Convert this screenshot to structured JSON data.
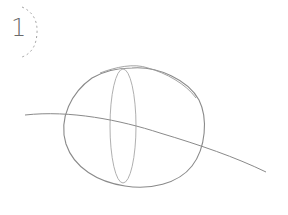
{
  "step": {
    "number": "1"
  },
  "drawing": {
    "description": "Pencil sketch: egg-shaped oval with vertical inner ellipse and a curved guideline crossing",
    "stroke_color": "#8a8a8a",
    "light_stroke_color": "#b5b5b5",
    "badge_dash_color": "#a0a0a0"
  }
}
